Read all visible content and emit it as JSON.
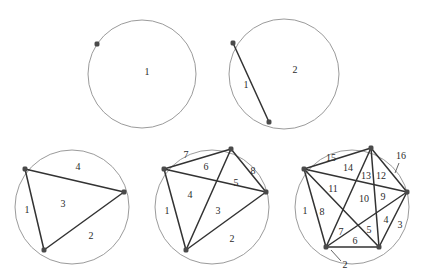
{
  "figure": {
    "stroke_colors": {
      "circle": "#9b9b9b",
      "chord": "#333333",
      "dot": "#4a4a4a",
      "label": "#2b2b2b",
      "leader": "#555555"
    },
    "background": "#ffffff"
  },
  "chart_data": {
    "type": "diagram",
    "xlabel": "",
    "ylabel": "",
    "categories": [
      "1 point",
      "2 points",
      "3 points",
      "4 points",
      "5 points"
    ],
    "values": [
      1,
      2,
      4,
      8,
      16
    ],
    "series": [
      {
        "name": "regions",
        "values": [
          1,
          2,
          4,
          8,
          16
        ]
      },
      {
        "name": "points",
        "values": [
          1,
          2,
          3,
          4,
          5
        ]
      },
      {
        "name": "chords",
        "values": [
          0,
          1,
          3,
          6,
          10
        ]
      }
    ],
    "annotations": [
      "Panel 1: 1 point, 0 chords, 1 region",
      "Panel 2: 2 points, 1 chord, 2 regions",
      "Panel 3: 3 points, 3 chords, 4 regions",
      "Panel 4: 4 points, 6 chords, 8 regions",
      "Panel 5: 5 points, 10 chords, 16 regions"
    ]
  },
  "panels": [
    {
      "id": "panel-1",
      "name": "circle-1-point",
      "circle": {
        "cx": 142,
        "cy": 74,
        "r": 54
      },
      "points": [
        {
          "x": 97,
          "y": 44
        }
      ],
      "chords": [],
      "labels": [
        {
          "text": "1",
          "x": 147,
          "y": 73
        }
      ],
      "leaders": []
    },
    {
      "id": "panel-2",
      "name": "circle-2-points",
      "circle": {
        "cx": 284,
        "cy": 74,
        "r": 55
      },
      "points": [
        {
          "x": 233,
          "y": 43
        },
        {
          "x": 269,
          "y": 122
        }
      ],
      "chords": [
        {
          "from": 0,
          "to": 1
        }
      ],
      "labels": [
        {
          "text": "1",
          "x": 246,
          "y": 86
        },
        {
          "text": "2",
          "x": 295,
          "y": 71
        }
      ],
      "leaders": []
    },
    {
      "id": "panel-3",
      "name": "circle-3-points",
      "circle": {
        "cx": 72,
        "cy": 207,
        "r": 57
      },
      "points": [
        {
          "x": 25,
          "y": 169
        },
        {
          "x": 124,
          "y": 192
        },
        {
          "x": 44,
          "y": 250
        }
      ],
      "chords": [
        {
          "from": 0,
          "to": 1
        },
        {
          "from": 1,
          "to": 2
        },
        {
          "from": 0,
          "to": 2
        }
      ],
      "labels": [
        {
          "text": "1",
          "x": 27,
          "y": 211
        },
        {
          "text": "2",
          "x": 91,
          "y": 237
        },
        {
          "text": "3",
          "x": 63,
          "y": 205
        },
        {
          "text": "4",
          "x": 78,
          "y": 168
        }
      ],
      "leaders": []
    },
    {
      "id": "panel-4",
      "name": "circle-4-points",
      "circle": {
        "cx": 212,
        "cy": 207,
        "r": 57
      },
      "points": [
        {
          "x": 164,
          "y": 169
        },
        {
          "x": 231,
          "y": 149
        },
        {
          "x": 266,
          "y": 192
        },
        {
          "x": 186,
          "y": 250
        }
      ],
      "chords": [
        {
          "from": 0,
          "to": 1
        },
        {
          "from": 0,
          "to": 2
        },
        {
          "from": 0,
          "to": 3
        },
        {
          "from": 1,
          "to": 2
        },
        {
          "from": 1,
          "to": 3
        },
        {
          "from": 2,
          "to": 3
        }
      ],
      "labels": [
        {
          "text": "1",
          "x": 167,
          "y": 212
        },
        {
          "text": "2",
          "x": 232,
          "y": 240
        },
        {
          "text": "3",
          "x": 218,
          "y": 212
        },
        {
          "text": "4",
          "x": 190,
          "y": 196
        },
        {
          "text": "5",
          "x": 236,
          "y": 184
        },
        {
          "text": "6",
          "x": 206,
          "y": 168
        },
        {
          "text": "7",
          "x": 186,
          "y": 156
        },
        {
          "text": "8",
          "x": 253,
          "y": 172
        }
      ],
      "leaders": []
    },
    {
      "id": "panel-5",
      "name": "circle-5-points",
      "circle": {
        "cx": 352,
        "cy": 207,
        "r": 57
      },
      "points": [
        {
          "x": 304,
          "y": 169
        },
        {
          "x": 371,
          "y": 148
        },
        {
          "x": 407,
          "y": 192
        },
        {
          "x": 379,
          "y": 247
        },
        {
          "x": 326,
          "y": 247
        }
      ],
      "chords": [
        {
          "from": 0,
          "to": 1
        },
        {
          "from": 0,
          "to": 2
        },
        {
          "from": 0,
          "to": 3
        },
        {
          "from": 0,
          "to": 4
        },
        {
          "from": 1,
          "to": 2
        },
        {
          "from": 1,
          "to": 3
        },
        {
          "from": 1,
          "to": 4
        },
        {
          "from": 2,
          "to": 3
        },
        {
          "from": 2,
          "to": 4
        },
        {
          "from": 3,
          "to": 4
        }
      ],
      "labels": [
        {
          "text": "1",
          "x": 305,
          "y": 212
        },
        {
          "text": "2",
          "x": 345,
          "y": 266
        },
        {
          "text": "3",
          "x": 400,
          "y": 226
        },
        {
          "text": "4",
          "x": 386,
          "y": 221
        },
        {
          "text": "5",
          "x": 369,
          "y": 231
        },
        {
          "text": "6",
          "x": 355,
          "y": 242
        },
        {
          "text": "7",
          "x": 341,
          "y": 233
        },
        {
          "text": "8",
          "x": 322,
          "y": 213
        },
        {
          "text": "9",
          "x": 383,
          "y": 198
        },
        {
          "text": "10",
          "x": 364,
          "y": 200
        },
        {
          "text": "11",
          "x": 333,
          "y": 190
        },
        {
          "text": "12",
          "x": 381,
          "y": 177
        },
        {
          "text": "13",
          "x": 366,
          "y": 177
        },
        {
          "text": "14",
          "x": 348,
          "y": 169
        },
        {
          "text": "15",
          "x": 331,
          "y": 159
        },
        {
          "text": "16",
          "x": 401,
          "y": 157
        }
      ],
      "leaders": [
        {
          "name": "leader-region-2",
          "x1": 341,
          "y1": 261,
          "x2": 331,
          "y2": 250
        },
        {
          "name": "leader-region-16",
          "x1": 399,
          "y1": 163,
          "x2": 395,
          "y2": 173
        }
      ]
    }
  ]
}
